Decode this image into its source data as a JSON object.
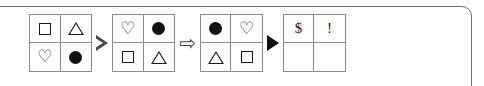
{
  "puzzle": {
    "type": "symbol-analogy",
    "frame_color": "#6e6e6e",
    "grid_border_color": "#8a8a8a",
    "symbol_color": "#1a1a1a",
    "grids": [
      {
        "name": "grid-1",
        "cells": [
          {
            "symbol": "square-outline",
            "glyph": "□"
          },
          {
            "symbol": "triangle-outline",
            "glyph": "△"
          },
          {
            "symbol": "heart-outline",
            "glyph": "♡"
          },
          {
            "symbol": "circle-filled",
            "glyph": "●"
          }
        ]
      },
      {
        "name": "grid-2",
        "cells": [
          {
            "symbol": "heart-outline",
            "glyph": "♡"
          },
          {
            "symbol": "circle-filled",
            "glyph": "●"
          },
          {
            "symbol": "square-outline",
            "glyph": "□"
          },
          {
            "symbol": "triangle-outline",
            "glyph": "△"
          }
        ]
      },
      {
        "name": "grid-3",
        "cells": [
          {
            "symbol": "circle-filled",
            "glyph": "●"
          },
          {
            "symbol": "heart-outline",
            "glyph": "♡"
          },
          {
            "symbol": "triangle-outline",
            "glyph": "△"
          },
          {
            "symbol": "square-outline",
            "glyph": "□"
          }
        ]
      },
      {
        "name": "grid-4",
        "cells": [
          {
            "symbol": "dollar-sign",
            "glyph": "$"
          },
          {
            "symbol": "exclamation-mark",
            "glyph": "!"
          },
          {
            "symbol": "empty",
            "glyph": ""
          },
          {
            "symbol": "empty",
            "glyph": ""
          }
        ]
      }
    ],
    "operators": [
      {
        "name": "hollow-triangle-right",
        "glyph": "▷"
      },
      {
        "name": "block-arrow-right",
        "glyph": "⇨"
      },
      {
        "name": "solid-triangle-right",
        "glyph": "▶"
      }
    ]
  }
}
